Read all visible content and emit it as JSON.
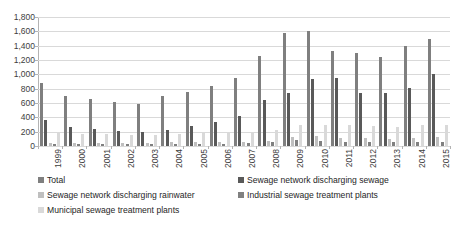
{
  "chart_data": {
    "type": "bar",
    "title": "",
    "subtitle": "",
    "xlabel": "",
    "ylabel": "",
    "grid": true,
    "legend_position": "bottom",
    "ylim": [
      0,
      1800
    ],
    "ytick_labels": [
      "1,800",
      "1,600",
      "1,400",
      "1,200",
      "1,000",
      "800",
      "600",
      "400",
      "200",
      "0"
    ],
    "ytick_values": [
      1800,
      1600,
      1400,
      1200,
      1000,
      800,
      600,
      400,
      200,
      0
    ],
    "categories": [
      "1999",
      "2000",
      "2001",
      "2002",
      "2003",
      "2004",
      "2005",
      "2006",
      "2007",
      "2008",
      "2009",
      "2010",
      "2011",
      "2012",
      "2013",
      "2014",
      "2015"
    ],
    "series": [
      {
        "name": "Total",
        "color": "#7f7f7f",
        "values": [
          880,
          700,
          660,
          610,
          580,
          700,
          760,
          840,
          950,
          1250,
          1580,
          1600,
          1330,
          1300,
          1240,
          1400,
          1500
        ]
      },
      {
        "name": "Sewage network discharging sewage",
        "color": "#595959",
        "values": [
          360,
          260,
          240,
          210,
          190,
          230,
          280,
          340,
          420,
          640,
          740,
          930,
          950,
          740,
          740,
          810,
          1000
        ]
      },
      {
        "name": "Sewage network discharging rainwater",
        "color": "#bfbfbf",
        "values": [
          40,
          40,
          40,
          40,
          40,
          50,
          50,
          60,
          60,
          70,
          130,
          140,
          110,
          110,
          100,
          110,
          120
        ]
      },
      {
        "name": "Industrial sewage treatment plants",
        "color": "#808080",
        "values": [
          30,
          30,
          30,
          30,
          30,
          30,
          30,
          30,
          40,
          50,
          80,
          70,
          60,
          60,
          60,
          60,
          60
        ]
      },
      {
        "name": "Municipal sewage treatment plants",
        "color": "#d9d9d9",
        "values": [
          190,
          170,
          170,
          160,
          160,
          170,
          190,
          190,
          200,
          220,
          290,
          300,
          290,
          280,
          270,
          290,
          300
        ]
      }
    ]
  },
  "legend": {
    "items": [
      {
        "label": "Total",
        "color": "#7f7f7f"
      },
      {
        "label": "Sewage network discharging sewage",
        "color": "#595959"
      },
      {
        "label": "Sewage network discharging rainwater",
        "color": "#bfbfbf"
      },
      {
        "label": "Industrial sewage treatment plants",
        "color": "#808080"
      },
      {
        "label": "Municipal sewage treatment plants",
        "color": "#d9d9d9"
      }
    ]
  },
  "axis": {
    "gridline_color": "#d9d9d9",
    "axis_color": "#b3b3b3",
    "tick_text_color": "#3d3d3d"
  }
}
